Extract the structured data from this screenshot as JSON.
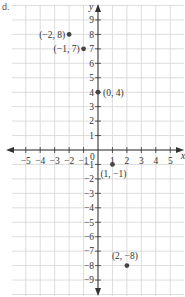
{
  "part_label": "d.",
  "chart_data": {
    "type": "scatter",
    "title": "",
    "xlabel": "x",
    "ylabel": "y",
    "xlim": [
      -5,
      5
    ],
    "ylim": [
      -9,
      9
    ],
    "grid": true,
    "x_ticks": [
      -5,
      -4,
      -3,
      -2,
      -1,
      1,
      2,
      3,
      4,
      5
    ],
    "y_ticks": [
      9,
      8,
      7,
      6,
      5,
      4,
      3,
      2,
      1,
      -1,
      -2,
      -3,
      -4,
      -5,
      -6,
      -7,
      -8,
      -9
    ],
    "origin_label": "0",
    "points": [
      {
        "x": -2,
        "y": 8,
        "label": "(−2, 8)"
      },
      {
        "x": -1,
        "y": 7,
        "label": "(−1, 7)"
      },
      {
        "x": 0,
        "y": 4,
        "label": "(0, 4)"
      },
      {
        "x": 1,
        "y": -1,
        "label": "(1, −1)"
      },
      {
        "x": 2,
        "y": -8,
        "label": "(2, −8)"
      }
    ]
  },
  "colors": {
    "grid": "#d4d4d4",
    "axis": "#333333",
    "point": "#444444"
  }
}
